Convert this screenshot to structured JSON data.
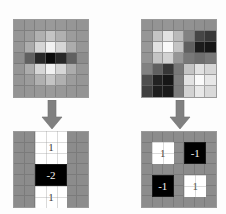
{
  "figure": {
    "background_color": "#fdfdfd",
    "grid_background_color": "#8c8c8c",
    "gridline_color": "#6e6e6e",
    "arrow_color": "#808080",
    "black_cell_color": "#000000",
    "white_cell_color": "#ffffff"
  },
  "panels": [
    {
      "id": "top-left",
      "name": "horizontal-center-surround-filter",
      "type": "grayscale-grid",
      "rows": 7,
      "cols": 7,
      "description": "Smooth grayscale receptive field: bright horizontal bands above and below a dark horizontal center bar",
      "intensities": [
        [
          148,
          150,
          152,
          154,
          152,
          150,
          148
        ],
        [
          150,
          156,
          176,
          196,
          176,
          156,
          150
        ],
        [
          150,
          172,
          214,
          242,
          214,
          172,
          150
        ],
        [
          140,
          96,
          40,
          12,
          40,
          96,
          140
        ],
        [
          150,
          172,
          214,
          242,
          214,
          172,
          150
        ],
        [
          150,
          156,
          176,
          196,
          176,
          156,
          150
        ],
        [
          148,
          150,
          152,
          154,
          152,
          150,
          148
        ]
      ]
    },
    {
      "id": "top-right",
      "name": "checkerboard-opponent-filter",
      "type": "grayscale-grid",
      "rows": 7,
      "cols": 7,
      "description": "Smooth grayscale receptive field: bright blob upper-left and lower-right, dark blob upper-right and lower-left",
      "intensities": [
        [
          146,
          148,
          150,
          148,
          146,
          144,
          142
        ],
        [
          150,
          196,
          226,
          186,
          130,
          70,
          56
        ],
        [
          152,
          226,
          250,
          196,
          96,
          28,
          22
        ],
        [
          148,
          196,
          210,
          150,
          120,
          110,
          120
        ],
        [
          130,
          96,
          54,
          120,
          196,
          226,
          214
        ],
        [
          78,
          34,
          22,
          126,
          226,
          250,
          232
        ],
        [
          64,
          30,
          26,
          124,
          210,
          232,
          218
        ]
      ]
    },
    {
      "id": "bottom-left",
      "name": "quantized-kernel-horizontal",
      "type": "kernel-grid",
      "rows": 7,
      "cols": 7,
      "background_cell_color": "#8c8c8c",
      "regions": [
        {
          "name": "kernel-cell-top-positive",
          "value": "1",
          "fill": "white",
          "col_start": 2,
          "col_span": 3,
          "row_start": 0,
          "row_span": 3
        },
        {
          "name": "kernel-cell-center-negative",
          "value": "-2",
          "fill": "black",
          "col_start": 2,
          "col_span": 3,
          "row_start": 3,
          "row_span": 2
        },
        {
          "name": "kernel-cell-bottom-positive",
          "value": "1",
          "fill": "white",
          "col_start": 2,
          "col_span": 3,
          "row_start": 5,
          "row_span": 2
        }
      ]
    },
    {
      "id": "bottom-right",
      "name": "quantized-kernel-checkerboard",
      "type": "kernel-grid",
      "rows": 7,
      "cols": 7,
      "background_cell_color": "#8c8c8c",
      "regions": [
        {
          "name": "kernel-cell-upper-left-positive",
          "value": "1",
          "fill": "white",
          "col_start": 1,
          "col_span": 2,
          "row_start": 1,
          "row_span": 2
        },
        {
          "name": "kernel-cell-upper-right-negative",
          "value": "-1",
          "fill": "black",
          "col_start": 4,
          "col_span": 2,
          "row_start": 1,
          "row_span": 2
        },
        {
          "name": "kernel-cell-lower-left-negative",
          "value": "-1",
          "fill": "black",
          "col_start": 1,
          "col_span": 2,
          "row_start": 4,
          "row_span": 2
        },
        {
          "name": "kernel-cell-lower-right-positive",
          "value": "1",
          "fill": "white",
          "col_start": 4,
          "col_span": 2,
          "row_start": 4,
          "row_span": 2
        }
      ]
    }
  ],
  "arrows": [
    {
      "id": "arrow-left",
      "name": "down-arrow-icon",
      "direction": "down",
      "color": "#808080"
    },
    {
      "id": "arrow-right",
      "name": "down-arrow-icon",
      "direction": "down",
      "color": "#808080"
    }
  ],
  "labels": {
    "left_top_positive": "1",
    "left_center_negative": "-2",
    "left_bottom_positive": "1",
    "right_upper_left": "1",
    "right_upper_right": "-1",
    "right_lower_left": "-1",
    "right_lower_right": "1"
  }
}
